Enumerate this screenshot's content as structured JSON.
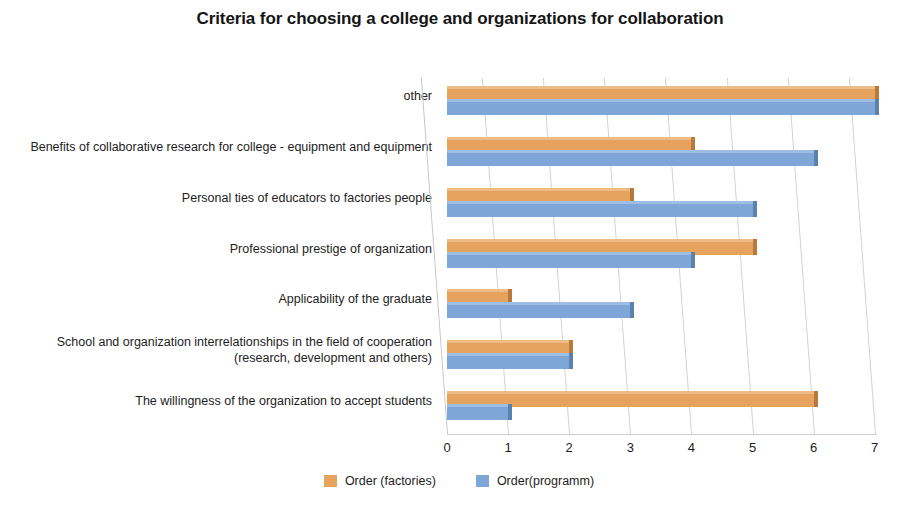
{
  "chart_data": {
    "type": "bar",
    "orientation": "horizontal",
    "title": "Criteria for choosing a college and organizations for collaboration",
    "xlabel": "",
    "ylabel": "",
    "xlim": [
      0,
      7
    ],
    "xticks": [
      "0",
      "1",
      "2",
      "3",
      "4",
      "5",
      "6",
      "7"
    ],
    "grid": true,
    "legend_position": "bottom-center",
    "categories": [
      "The willingness of the organization to accept students",
      "School and organization interrelationships in the field of cooperation (research, development and others)",
      "Applicability of the graduate",
      "Professional prestige of organization",
      "Personal ties of educators to factories people",
      "Benefits of collaborative research for college - equipment and equipment",
      "other"
    ],
    "series": [
      {
        "name": "Order (factories)",
        "color": "#e5a35e",
        "values": [
          6,
          2,
          1,
          5,
          3,
          4,
          7
        ]
      },
      {
        "name": "Order(programm)",
        "color": "#7ea7d8",
        "values": [
          1,
          2,
          3,
          4,
          5,
          6,
          7
        ]
      }
    ]
  },
  "legend": {
    "items": [
      {
        "label": "Order (factories)",
        "color": "#e5a35e"
      },
      {
        "label": "Order(programm)",
        "color": "#7ea7d8"
      }
    ]
  }
}
